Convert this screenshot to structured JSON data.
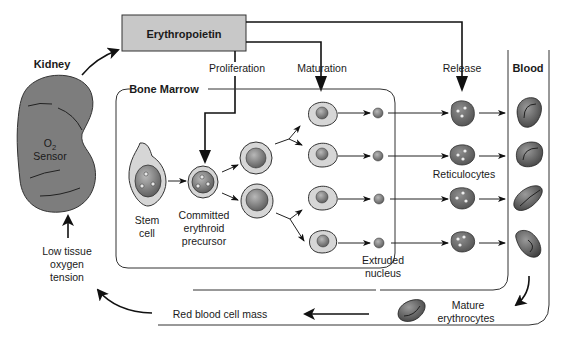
{
  "diagram": {
    "hormone_box": {
      "label": "Erythropoietin",
      "fill": "#c8c8c8"
    },
    "organ": {
      "name": "Kidney",
      "sensor_line1": "O",
      "sensor_subscript": "2",
      "sensor_line2": "Sensor",
      "fill": "#7a7a7a"
    },
    "regions": {
      "bone_marrow": "Bone Marrow",
      "blood": "Blood"
    },
    "actions": {
      "proliferation": "Proliferation",
      "maturation": "Maturation",
      "release": "Release"
    },
    "cell_labels": {
      "stem_cell_line1": "Stem",
      "stem_cell_line2": "cell",
      "committed_line1": "Committed",
      "committed_line2": "erythroid",
      "committed_line3": "precursor",
      "reticulocytes": "Reticulocytes",
      "extruded_line1": "Extruded",
      "extruded_line2": "nucleus",
      "mature_line1": "Mature",
      "mature_line2": "erythrocytes"
    },
    "feedback": {
      "rbc_mass": "Red blood cell mass",
      "low_o2_line1": "Low tissue",
      "low_o2_line2": "oxygen",
      "low_o2_line3": "tension"
    },
    "colors": {
      "cell_cytoplasm_light": "#d6d6d6",
      "nucleus": "#7d7d7d",
      "reticulocyte": "#6e6e6e",
      "erythrocyte": "#5e5e5e",
      "line": "#111111"
    }
  }
}
